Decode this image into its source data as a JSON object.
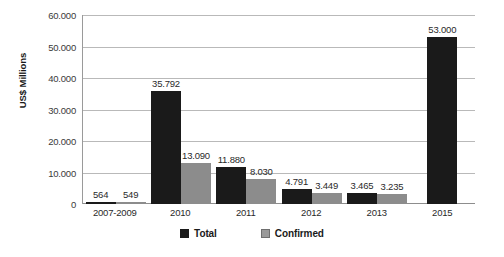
{
  "chart_data": {
    "type": "bar",
    "title": "",
    "xlabel": "",
    "ylabel": "US$ Millions",
    "categories": [
      "2007-2009",
      "2010",
      "2011",
      "2012",
      "2013",
      "2015"
    ],
    "series": [
      {
        "name": "Total",
        "color": "#1a1a1a",
        "values": [
          564,
          35792,
          11880,
          4791,
          3465,
          53000
        ],
        "labels": [
          "564",
          "35.792",
          "11.880",
          "4.791",
          "3.465",
          "53.000"
        ]
      },
      {
        "name": "Confirmed",
        "color": "#8c8c8c",
        "values": [
          549,
          13090,
          8030,
          3449,
          3235,
          null
        ],
        "labels": [
          "549",
          "13.090",
          "8.030",
          "3.449",
          "3.235",
          ""
        ]
      }
    ],
    "ylim": [
      0,
      60000
    ],
    "ytick_labels": [
      "60.000",
      "50.000",
      "40.000",
      "30.000",
      "20.000",
      "10.000",
      "0"
    ],
    "ytick_values": [
      60000,
      50000,
      40000,
      30000,
      20000,
      10000,
      0
    ],
    "grid": true,
    "legend_position": "bottom"
  }
}
